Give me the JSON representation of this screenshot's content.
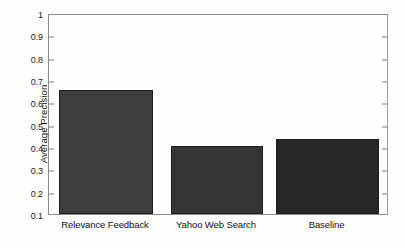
{
  "chart_data": {
    "type": "bar",
    "title": "",
    "xlabel": "",
    "ylabel": "Average Precision",
    "categories": [
      "Relevance Feedback",
      "Yahoo Web Search",
      "Baseline"
    ],
    "values": [
      0.655,
      0.405,
      0.435
    ],
    "ylim": [
      0.1,
      1.0
    ],
    "yticks": [
      "0.1",
      "0.2",
      "0.3",
      "0.4",
      "0.5",
      "0.6",
      "0.7",
      "0.8",
      "0.9",
      "1"
    ],
    "ytick_values": [
      0.1,
      0.2,
      0.3,
      0.4,
      0.5,
      0.6,
      0.7,
      0.8,
      0.9,
      1.0
    ],
    "grid": false,
    "legend": false,
    "bar_colors": [
      "#3d3d3d",
      "#343434",
      "#282828"
    ],
    "background_color": "#ffffff",
    "axis_color": "#8a8a8a"
  }
}
